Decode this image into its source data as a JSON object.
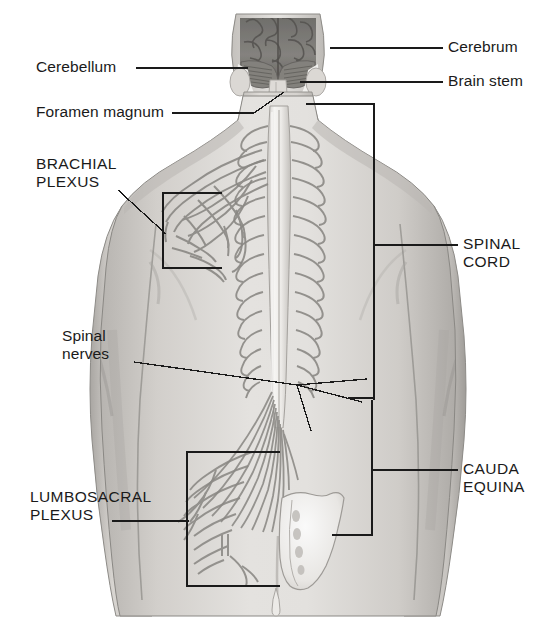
{
  "figure": {
    "width": 556,
    "height": 634,
    "background": "#ffffff",
    "ink_color": "#1a1a1a"
  },
  "palette": {
    "skin_light": "#e9e7e4",
    "skin_mid": "#cdcac6",
    "skin_shadow": "#b0aeaa",
    "skin_deep": "#97958f",
    "brain_dark": "#7b7a77",
    "brain_darker": "#5f5e5b",
    "cord_light": "#f3f2f0",
    "nerve_line": "#8e8c88",
    "outline": "#6f6d6a",
    "leader": "#1a1a1a"
  },
  "labels": [
    {
      "id": "cerebrum",
      "text": "Cerebrum",
      "case": "mixed",
      "side": "right",
      "x": 448,
      "y": 40,
      "leader": {
        "type": "line",
        "x1": 392,
        "y1": 48,
        "x2": 443,
        "y2": 48
      },
      "pointer_to": "cerebrum-region"
    },
    {
      "id": "brain-stem",
      "text": "Brain stem",
      "case": "mixed",
      "side": "right",
      "x": 448,
      "y": 74,
      "leader": {
        "type": "line",
        "x1": 392,
        "y1": 82,
        "x2": 443,
        "y2": 82
      },
      "pointer_to": "brain-stem-region"
    },
    {
      "id": "cerebellum",
      "text": "Cerebellum",
      "case": "mixed",
      "side": "left",
      "x": 36,
      "y": 60,
      "leader": {
        "type": "line",
        "x1": 136,
        "y1": 68,
        "x2": 243,
        "y2": 68
      },
      "pointer_to": "cerebellum-region"
    },
    {
      "id": "foramen-magnum",
      "text": "Foramen magnum",
      "case": "mixed",
      "side": "left",
      "x": 36,
      "y": 105,
      "leader": {
        "type": "polyline",
        "points": "172,113 258,113 288,90"
      },
      "pointer_to": "foramen-magnum-region"
    },
    {
      "id": "brachial-plexus",
      "text": "BRACHIAL\nPLEXUS",
      "case": "caps",
      "side": "left",
      "x": 36,
      "y": 157,
      "leader": {
        "type": "line",
        "x1": 118,
        "y1": 190,
        "x2": 168,
        "y2": 232
      },
      "bracket": {
        "x": 163,
        "y_top": 193,
        "y_bottom": 268,
        "x_end": 222,
        "orientation": "left"
      },
      "pointer_to": "brachial-plexus-region"
    },
    {
      "id": "spinal-nerves",
      "text": "Spinal\nnerves",
      "case": "mixed",
      "side": "left",
      "x": 62,
      "y": 329,
      "leader": {
        "type": "fan",
        "origin": "134,362",
        "hub": "297,385",
        "tips": [
          "367,380",
          "363,402",
          "310,430"
        ]
      },
      "pointer_to": "spinal-nerve-roots"
    },
    {
      "id": "lumbosacral-plexus",
      "text": "LUMBOSACRAL\nPLEXUS",
      "case": "caps",
      "side": "left",
      "x": 30,
      "y": 490,
      "leader": {
        "type": "line",
        "x1": 112,
        "y1": 521,
        "x2": 187,
        "y2": 521
      },
      "bracket": {
        "x": 187,
        "y_top": 452,
        "y_bottom": 586,
        "x_end": 280,
        "orientation": "left"
      },
      "pointer_to": "lumbosacral-plexus-region"
    },
    {
      "id": "spinal-cord",
      "text": "SPINAL\nCORD",
      "case": "caps",
      "side": "right",
      "x": 463,
      "y": 237,
      "leader": {
        "type": "line",
        "x1": 374,
        "y1": 245,
        "x2": 458,
        "y2": 245
      },
      "bracket": {
        "x": 374,
        "y_top": 104,
        "y_bottom": 400,
        "x_end": 306,
        "orientation": "right"
      },
      "pointer_to": "spinal-cord-region"
    },
    {
      "id": "cauda-equina",
      "text": "CAUDA\nEQUINA",
      "case": "caps",
      "side": "right",
      "x": 463,
      "y": 462,
      "leader": {
        "type": "line",
        "x1": 372,
        "y1": 470,
        "x2": 458,
        "y2": 470
      },
      "bracket": {
        "x": 372,
        "y_top": 400,
        "y_bottom": 535,
        "x_end": 332,
        "orientation": "right"
      },
      "pointer_to": "cauda-equina-region"
    }
  ],
  "anatomy_regions": [
    {
      "id": "cerebrum-region",
      "name": "cerebrum",
      "note": "dark convoluted cerebral hemispheres at top of head"
    },
    {
      "id": "cerebellum-region",
      "name": "cerebellum",
      "note": "lower lobes of brain beneath cerebrum"
    },
    {
      "id": "brain-stem-region",
      "name": "brain stem",
      "note": "central stalk descending from brain"
    },
    {
      "id": "foramen-magnum-region",
      "name": "foramen magnum",
      "note": "opening at skull base"
    },
    {
      "id": "spinal-cord-region",
      "name": "spinal cord",
      "note": "long pale cord down midline of back"
    },
    {
      "id": "spinal-nerve-roots",
      "name": "spinal nerves",
      "note": "paired nerve roots exiting cord laterally"
    },
    {
      "id": "brachial-plexus-region",
      "name": "brachial plexus",
      "note": "nerve network at upper left shoulder"
    },
    {
      "id": "lumbosacral-plexus-region",
      "name": "lumbosacral plexus",
      "note": "nerve network at lower left back"
    },
    {
      "id": "cauda-equina-region",
      "name": "cauda equina",
      "note": "bundle of nerve roots below cord terminus"
    },
    {
      "id": "sacrum-region",
      "name": "sacrum",
      "note": "pale triangular bone at base of spine"
    }
  ]
}
